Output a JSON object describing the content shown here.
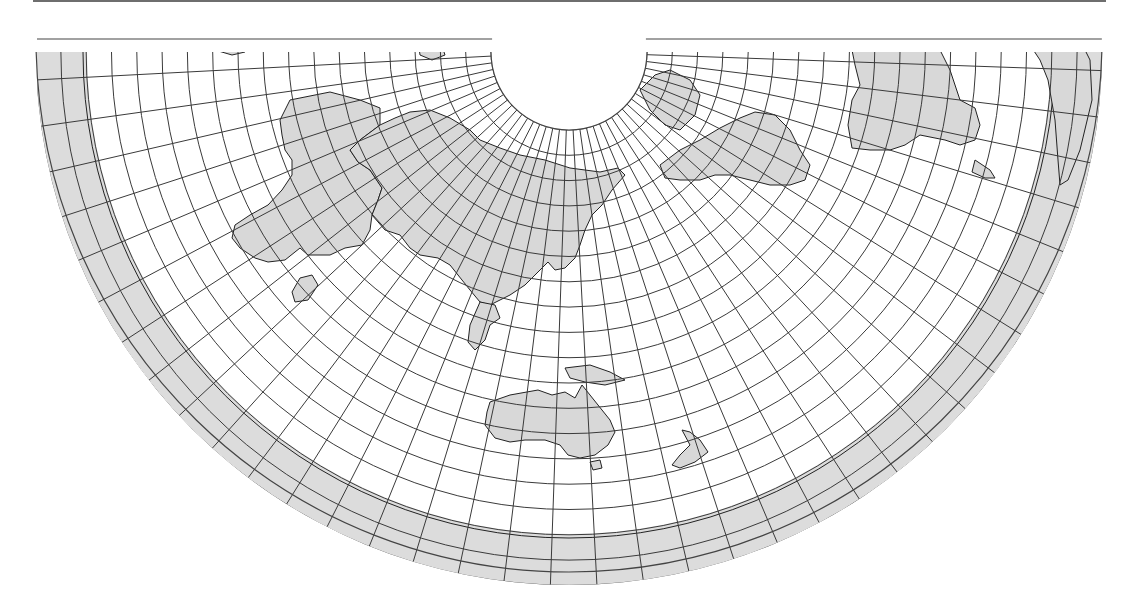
{
  "figure": {
    "type": "world-map-conic-projection",
    "colors": {
      "land_fill": "#d8d8d8",
      "ocean": "#ffffff",
      "graticule": "#3a3a3a",
      "coastline": "#222222",
      "top_rule": "#6e6e6e"
    }
  },
  "projection": {
    "center_x": 569,
    "center_y": 52,
    "inner_radius": 78,
    "outer_radius": 533,
    "ring_step": 25.3,
    "meridian_step_deg": 5,
    "meridian_span_deg": 92,
    "frame_top": 39,
    "frame_left": 37,
    "frame_right": 1103
  },
  "landmasses": [
    {
      "name": "antarctica-band",
      "kind": "ring",
      "r1": 482,
      "r2": 533
    },
    {
      "name": "africa",
      "points": "290,100 330,92 360,100 380,108 380,125 360,140 350,150 358,162 370,170 382,188 378,200 372,215 370,230 362,245 345,248 330,255 308,255 300,248 285,260 268,262 255,258 240,248 232,238 235,225 250,215 268,205 282,190 292,175 292,160 285,150 282,135 280,120"
    },
    {
      "name": "madagascar",
      "points": "300,278 312,275 318,285 308,300 295,302 292,292"
    },
    {
      "name": "europe-asia",
      "points": "380,125 395,118 410,112 430,110 450,118 470,130 480,140 500,148 520,155 545,160 570,168 600,172 618,168 625,175 612,190 602,205 592,215 585,230 580,245 575,258 565,268 555,270 548,262 540,270 525,285 510,295 500,300 490,305 480,302 470,290 462,280 450,265 438,258 420,255 410,248 400,235 385,230 372,215 378,200 382,188 370,170 358,162 350,150 360,140"
    },
    {
      "name": "indochina",
      "points": "480,302 495,305 500,318 490,325 485,340 475,350 468,342 470,325"
    },
    {
      "name": "indonesia-newguinea",
      "points": "565,368 590,365 610,372 625,380 605,385 585,382 570,378"
    },
    {
      "name": "australia",
      "points": "490,402 510,395 538,390 552,395 565,392 575,398 582,385 590,395 598,405 610,420 615,432 608,445 595,455 580,458 568,455 560,445 545,440 525,440 510,442 495,438 485,425 487,412"
    },
    {
      "name": "tasmania",
      "points": "590,462 600,460 602,468 593,470"
    },
    {
      "name": "new-zealand",
      "points": "682,430 690,432 700,440 708,452 695,462 680,468 672,465 680,455 690,445"
    },
    {
      "name": "north-america",
      "points": "660,165 680,150 700,140 720,128 740,118 755,112 775,115 790,130 800,150 810,165 805,180 790,185 770,185 750,180 730,175 715,175 700,180 680,180 665,178"
    },
    {
      "name": "greenland",
      "points": "640,90 655,75 670,70 690,80 700,95 695,115 680,130 665,125 650,110"
    },
    {
      "name": "south-america",
      "points": "850,40 935,40 950,70 960,100 975,108 980,125 975,140 960,145 945,140 920,135 905,145 890,150 870,150 852,148 848,125 852,100 860,85 855,65"
    },
    {
      "name": "south-america-tip",
      "points": "975,160 990,170 995,178 985,178 972,172"
    },
    {
      "name": "patagonia-east",
      "points": "1030,45 1080,40 1090,60 1092,100 1080,150 1068,180 1060,185 1058,160 1055,120 1048,80 1040,60"
    },
    {
      "name": "greenland-top",
      "points": "418,40 440,40 445,55 432,60 420,55"
    },
    {
      "name": "iceland-area",
      "points": "200,40 250,40 245,52 232,55 215,50"
    }
  ]
}
